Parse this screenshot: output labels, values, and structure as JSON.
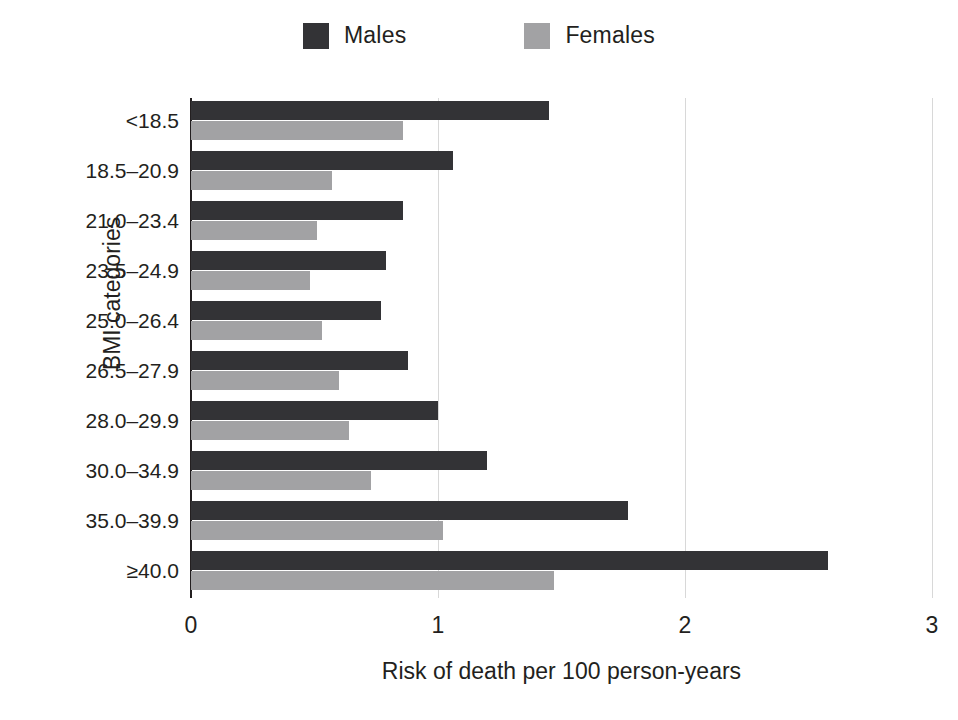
{
  "chart_data": {
    "type": "bar",
    "orientation": "horizontal",
    "title": "",
    "xlabel": "Risk of death per 100 person-years",
    "ylabel": "BMI categories",
    "categories": [
      "<18.5",
      "18.5–20.9",
      "21.0–23.4",
      "23.5–24.9",
      "25.0–26.4",
      "26.5–27.9",
      "28.0–29.9",
      "30.0–34.9",
      "35.0–39.9",
      "≥40.0"
    ],
    "series": [
      {
        "name": "Males",
        "color": "#333336",
        "values": [
          1.45,
          1.06,
          0.86,
          0.79,
          0.77,
          0.88,
          1.0,
          1.2,
          1.77,
          2.58
        ]
      },
      {
        "name": "Females",
        "color": "#a2a2a4",
        "values": [
          0.86,
          0.57,
          0.51,
          0.48,
          0.53,
          0.6,
          0.64,
          0.73,
          1.02,
          1.47
        ]
      }
    ],
    "xlim": [
      0,
      3
    ],
    "xticks": [
      0,
      1,
      2,
      3
    ],
    "xtick_labels": [
      "0",
      "1",
      "2",
      "3"
    ],
    "grid": "vertical",
    "gridlines_at": [
      1,
      2,
      3
    ],
    "legend_position": "top-center"
  },
  "legend": {
    "items": [
      {
        "label": "Males",
        "swatch": "males-swatch"
      },
      {
        "label": "Females",
        "swatch": "females-swatch"
      }
    ]
  },
  "colors": {
    "males": "#333336",
    "females": "#a2a2a4",
    "grid": "#d8d8d8",
    "axis": "#231f20",
    "background": "#ffffff"
  }
}
